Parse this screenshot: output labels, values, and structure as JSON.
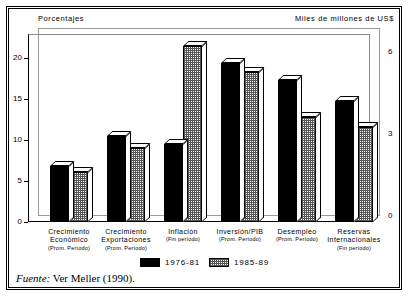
{
  "figure": {
    "left_axis_caption": "Porcentajes",
    "right_axis_caption": "Miles de millones de US$",
    "source_prefix": "Fuente:",
    "source_text": " Ver Meller (1990)."
  },
  "legend": {
    "items": [
      {
        "label": "1976-81",
        "swatch": "s1",
        "color": "#000000"
      },
      {
        "label": "1985-89",
        "swatch": "s2",
        "color": "#aaaaaa"
      }
    ]
  },
  "chart_data": {
    "type": "bar",
    "title": "",
    "xlabel": "",
    "ylabel": "Porcentajes",
    "y2label": "Miles de millones de US$",
    "ylim": [
      0,
      22.5
    ],
    "y2lim": [
      0,
      6.75
    ],
    "yticks": [
      0,
      5,
      10,
      15,
      20
    ],
    "y2ticks": [
      0,
      3,
      6
    ],
    "grid": false,
    "legend_position": "bottom",
    "categories": [
      "Crecimiento Económico (Prom. Período)",
      "Crecimiento Exportaciones (Prom. Período)",
      "Inflación (Fin período)",
      "Inversión/PIB (Prom. Período)",
      "Desempleo (Prom. Período)",
      "Reservas Internacionales (Fin período)"
    ],
    "category_lines": [
      {
        "l1": "Crecimiento",
        "l2": "Económico",
        "l3": "(Prom. Período)"
      },
      {
        "l1": "Crecimiento",
        "l2": "Exportaciones",
        "l3": "(Prom. Período)"
      },
      {
        "l1": "Inflación",
        "l2": "",
        "l3": "(Fin período)"
      },
      {
        "l1": "Inversión/PIB",
        "l2": "",
        "l3": "(Prom. Período)"
      },
      {
        "l1": "Desempleo",
        "l2": "",
        "l3": "(Prom. Período)"
      },
      {
        "l1": "Reservas",
        "l2": "Internacionales",
        "l3": "(Fin período)"
      }
    ],
    "series": [
      {
        "name": "1976-81",
        "values": [
          6.8,
          10.5,
          9.5,
          19.5,
          17.4,
          14.8
        ]
      },
      {
        "name": "1985-89",
        "values": [
          6.1,
          9.0,
          21.5,
          18.4,
          12.8,
          11.6
        ]
      }
    ]
  }
}
